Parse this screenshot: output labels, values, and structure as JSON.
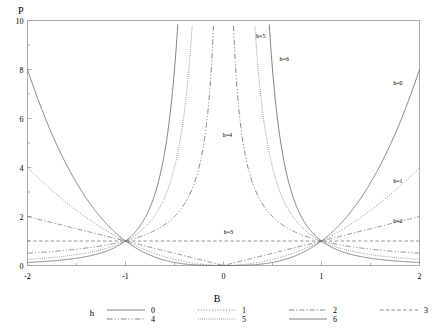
{
  "chart_data": {
    "type": "line",
    "title": "",
    "xlabel": "B",
    "ylabel": "P",
    "xlim": [
      -2,
      2
    ],
    "ylim": [
      0,
      10
    ],
    "xticks": [
      -2,
      -1,
      0,
      1,
      2
    ],
    "xtick_labels": [
      "-2",
      "-1",
      "0",
      "1",
      "2"
    ],
    "yticks": [
      0,
      2,
      4,
      6,
      8,
      10
    ],
    "ytick_labels": [
      "0",
      "2",
      "4",
      "6",
      "8",
      "10"
    ],
    "grid": false,
    "legend_position": "bottom",
    "legend_title": "h",
    "series": [
      {
        "name": "0",
        "label": "h=0",
        "h": 0,
        "style": "solid",
        "description": "P = |B|^(3-0) = |B|^3 rising steeply from 8 at B=-2 to 0 at B=0 to 8 at B=2",
        "exponent": 3
      },
      {
        "name": "1",
        "label": "h=1",
        "h": 1,
        "style": "dotted",
        "description": "P = |B|^2, value 4 at B=-2, 1 at B=-1, 0 at B=0, 4 at B=2",
        "exponent": 2
      },
      {
        "name": "2",
        "label": "h=2",
        "h": 2,
        "style": "dashdot",
        "description": "P = |B|^1, value 2 at B=-2, 1 at B=-1, 0 at B=0, 2 at B=2",
        "exponent": 1
      },
      {
        "name": "3",
        "label": "h=3",
        "h": 3,
        "style": "dashed",
        "description": "P = 1 constant horizontal line at P=1",
        "exponent": 0
      },
      {
        "name": "4",
        "label": "h=4",
        "h": 4,
        "style": "dashdotdot",
        "description": "P = |B|^-1, asymptotic at B=0, 0.5 at B=-2, 1 at B=-1",
        "exponent": -1
      },
      {
        "name": "5",
        "label": "h=5",
        "h": 5,
        "style": "finedot",
        "description": "P = |B|^-2, asymptotic at B=0, 0.25 at B=-2, 1 at B=-1",
        "exponent": -2
      },
      {
        "name": "6",
        "label": "h=6",
        "h": 6,
        "style": "solid",
        "description": "P = |B|^-3, asymptotic at B=0, 0.125 at B=-2, 1 at B=-1",
        "exponent": -3
      }
    ],
    "annotations": [
      {
        "text": "h=5",
        "x": 0.38,
        "y": 9.3
      },
      {
        "text": "h=6",
        "x": 0.62,
        "y": 8.35
      },
      {
        "text": "h=0",
        "x": 1.78,
        "y": 7.35
      },
      {
        "text": "h=4",
        "x": 0.04,
        "y": 5.25
      },
      {
        "text": "h=1",
        "x": 1.78,
        "y": 3.35
      },
      {
        "text": "h=2",
        "x": 1.78,
        "y": 1.72
      },
      {
        "text": "h=3",
        "x": 0.05,
        "y": 1.3
      }
    ],
    "colors": {
      "axis": "#9a9a9a",
      "curve": "#6b6b6b",
      "text": "#000000",
      "background": "#ffffff"
    }
  },
  "legend": {
    "title": "h",
    "entries": [
      {
        "label": "0",
        "style": "solid"
      },
      {
        "label": "1",
        "style": "dotted"
      },
      {
        "label": "2",
        "style": "dashdot"
      },
      {
        "label": "3",
        "style": "dashed"
      },
      {
        "label": "4",
        "style": "dashdotdot"
      },
      {
        "label": "5",
        "style": "finedot"
      },
      {
        "label": "6",
        "style": "solid"
      }
    ]
  },
  "axes": {
    "y_title": "P",
    "x_title": "B"
  }
}
